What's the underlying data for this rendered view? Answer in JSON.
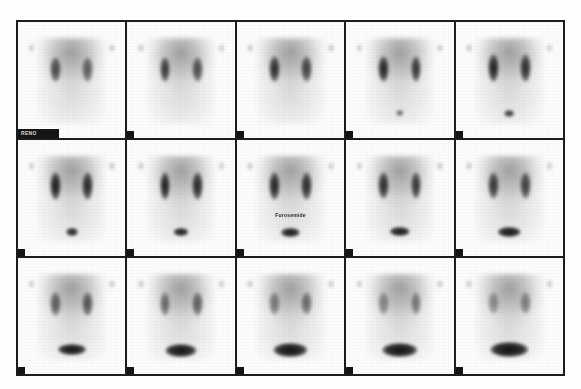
{
  "study": {
    "modality_label": "renal-scintigraphy-montage",
    "frame_id_label": "RENO",
    "annotation_drug": "Furosemide",
    "rows": 3,
    "columns": 5,
    "total_frames": 15,
    "background_color": "#fdfdfd",
    "grid_line_color": "#1c1c1c",
    "uptake_color": "#111111"
  },
  "frames": [
    {
      "index": 1,
      "row": 1,
      "col": 1,
      "kidney_left_opacity": 0.72,
      "kidney_right_opacity": 0.62,
      "kidney_width": 10,
      "kidney_height": 22,
      "kidney_top": 30,
      "bladder_opacity": 0.0,
      "bladder_width": 0,
      "bladder_height": 0,
      "bladder_top": 80,
      "annotation": "",
      "has_id_bar": true,
      "id_bar_text": "RENO"
    },
    {
      "index": 2,
      "row": 1,
      "col": 2,
      "kidney_left_opacity": 0.8,
      "kidney_right_opacity": 0.7,
      "kidney_width": 10,
      "kidney_height": 22,
      "kidney_top": 30,
      "bladder_opacity": 0.0,
      "bladder_width": 0,
      "bladder_height": 0,
      "bladder_top": 80,
      "annotation": "",
      "has_id_bar": false,
      "id_bar_text": ""
    },
    {
      "index": 3,
      "row": 1,
      "col": 3,
      "kidney_left_opacity": 0.86,
      "kidney_right_opacity": 0.76,
      "kidney_width": 10,
      "kidney_height": 23,
      "kidney_top": 29,
      "bladder_opacity": 0.0,
      "bladder_width": 0,
      "bladder_height": 0,
      "bladder_top": 80,
      "annotation": "",
      "has_id_bar": false,
      "id_bar_text": ""
    },
    {
      "index": 4,
      "row": 1,
      "col": 4,
      "kidney_left_opacity": 0.9,
      "kidney_right_opacity": 0.82,
      "kidney_width": 10,
      "kidney_height": 23,
      "kidney_top": 29,
      "bladder_opacity": 0.55,
      "bladder_width": 7,
      "bladder_height": 5,
      "bladder_top": 76,
      "annotation": "",
      "has_id_bar": false,
      "id_bar_text": ""
    },
    {
      "index": 5,
      "row": 1,
      "col": 5,
      "kidney_left_opacity": 0.92,
      "kidney_right_opacity": 0.86,
      "kidney_width": 10,
      "kidney_height": 24,
      "kidney_top": 28,
      "bladder_opacity": 0.75,
      "bladder_width": 9,
      "bladder_height": 6,
      "bladder_top": 76,
      "annotation": "",
      "has_id_bar": false,
      "id_bar_text": ""
    },
    {
      "index": 6,
      "row": 2,
      "col": 1,
      "kidney_left_opacity": 0.93,
      "kidney_right_opacity": 0.88,
      "kidney_width": 10,
      "kidney_height": 24,
      "kidney_top": 28,
      "bladder_opacity": 0.86,
      "bladder_width": 11,
      "bladder_height": 7,
      "bladder_top": 76,
      "annotation": "",
      "has_id_bar": false,
      "id_bar_text": ""
    },
    {
      "index": 7,
      "row": 2,
      "col": 2,
      "kidney_left_opacity": 0.92,
      "kidney_right_opacity": 0.88,
      "kidney_width": 10,
      "kidney_height": 24,
      "kidney_top": 28,
      "bladder_opacity": 0.9,
      "bladder_width": 14,
      "bladder_height": 7,
      "bladder_top": 76,
      "annotation": "",
      "has_id_bar": false,
      "id_bar_text": ""
    },
    {
      "index": 8,
      "row": 2,
      "col": 3,
      "kidney_left_opacity": 0.9,
      "kidney_right_opacity": 0.86,
      "kidney_width": 10,
      "kidney_height": 24,
      "kidney_top": 28,
      "bladder_opacity": 0.92,
      "bladder_width": 17,
      "bladder_height": 8,
      "bladder_top": 76,
      "annotation": "Furosemide",
      "has_id_bar": false,
      "id_bar_text": ""
    },
    {
      "index": 9,
      "row": 2,
      "col": 4,
      "kidney_left_opacity": 0.86,
      "kidney_right_opacity": 0.82,
      "kidney_width": 10,
      "kidney_height": 23,
      "kidney_top": 28,
      "bladder_opacity": 0.93,
      "bladder_width": 19,
      "bladder_height": 8,
      "bladder_top": 75,
      "annotation": "",
      "has_id_bar": false,
      "id_bar_text": ""
    },
    {
      "index": 10,
      "row": 2,
      "col": 5,
      "kidney_left_opacity": 0.8,
      "kidney_right_opacity": 0.76,
      "kidney_width": 10,
      "kidney_height": 23,
      "kidney_top": 28,
      "bladder_opacity": 0.94,
      "bladder_width": 21,
      "bladder_height": 9,
      "bladder_top": 75,
      "annotation": "",
      "has_id_bar": false,
      "id_bar_text": ""
    },
    {
      "index": 11,
      "row": 3,
      "col": 1,
      "kidney_left_opacity": 0.62,
      "kidney_right_opacity": 0.66,
      "kidney_width": 10,
      "kidney_height": 21,
      "kidney_top": 29,
      "bladder_opacity": 0.95,
      "bladder_width": 26,
      "bladder_height": 10,
      "bladder_top": 74,
      "annotation": "",
      "has_id_bar": false,
      "id_bar_text": ""
    },
    {
      "index": 12,
      "row": 3,
      "col": 2,
      "kidney_left_opacity": 0.55,
      "kidney_right_opacity": 0.6,
      "kidney_width": 10,
      "kidney_height": 21,
      "kidney_top": 29,
      "bladder_opacity": 0.95,
      "bladder_width": 29,
      "bladder_height": 11,
      "bladder_top": 74,
      "annotation": "",
      "has_id_bar": false,
      "id_bar_text": ""
    },
    {
      "index": 13,
      "row": 3,
      "col": 3,
      "kidney_left_opacity": 0.48,
      "kidney_right_opacity": 0.54,
      "kidney_width": 10,
      "kidney_height": 20,
      "kidney_top": 29,
      "bladder_opacity": 0.96,
      "bladder_width": 31,
      "bladder_height": 12,
      "bladder_top": 73,
      "annotation": "",
      "has_id_bar": false,
      "id_bar_text": ""
    },
    {
      "index": 14,
      "row": 3,
      "col": 4,
      "kidney_left_opacity": 0.42,
      "kidney_right_opacity": 0.48,
      "kidney_width": 10,
      "kidney_height": 20,
      "kidney_top": 29,
      "bladder_opacity": 0.96,
      "bladder_width": 33,
      "bladder_height": 12,
      "bladder_top": 73,
      "annotation": "",
      "has_id_bar": false,
      "id_bar_text": ""
    },
    {
      "index": 15,
      "row": 3,
      "col": 5,
      "kidney_left_opacity": 0.38,
      "kidney_right_opacity": 0.44,
      "kidney_width": 10,
      "kidney_height": 19,
      "kidney_top": 29,
      "bladder_opacity": 0.97,
      "bladder_width": 35,
      "bladder_height": 13,
      "bladder_top": 72,
      "annotation": "",
      "has_id_bar": false,
      "id_bar_text": ""
    }
  ]
}
